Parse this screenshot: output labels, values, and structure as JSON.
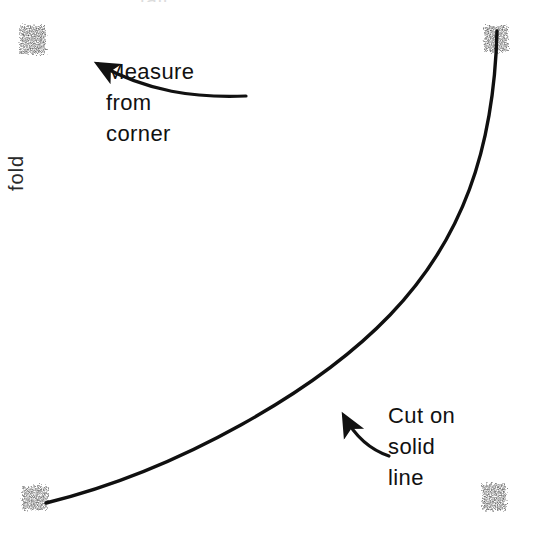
{
  "figure": {
    "background_color": "#ffffff",
    "ink_color": "#111111",
    "border_style": "rough charcoal dashed rectangle"
  },
  "annotations": [
    {
      "id": "measure",
      "text": "Measure\nfrom\ncorner",
      "lines": [
        "Measure",
        "from",
        "corner"
      ],
      "points_to": "top-left corner",
      "arrow": "curved-arrow-up-left"
    },
    {
      "id": "cut",
      "text": "Cut on\nsolid\nline",
      "lines": [
        "Cut on",
        "solid",
        "line"
      ],
      "points_to": "curved cutting line",
      "arrow": "curved-arrow-up-left"
    }
  ],
  "edge_labels": {
    "top_cropped": "tail",
    "left_cropped": "fold"
  },
  "shapes": {
    "rectangle": {
      "left": 22,
      "top": 28,
      "right": 503,
      "bottom": 508
    },
    "cut_curve": {
      "description": "smooth concave curve from top-right corner down to bottom-left edge",
      "start": [
        497,
        30
      ],
      "end": [
        48,
        505
      ],
      "type": "quadratic-ease"
    }
  }
}
